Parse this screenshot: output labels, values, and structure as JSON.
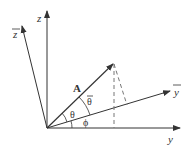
{
  "diagram": {
    "axes": {
      "z": {
        "label": "z"
      },
      "z_bar": {
        "label": "z"
      },
      "y": {
        "label": "y"
      },
      "y_bar": {
        "label": "y"
      }
    },
    "vector": {
      "label": "A"
    },
    "angles": {
      "theta": "θ",
      "theta_bar": "θ",
      "phi": "ϕ"
    },
    "colors": {
      "stroke": "#333333",
      "dashed": "#777777"
    }
  }
}
